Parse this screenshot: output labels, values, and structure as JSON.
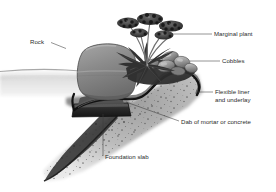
{
  "figure": {
    "background_color": "#ffffff",
    "line_color": "#3a3a3a",
    "text_color": "#2b2b2b"
  },
  "labels": {
    "rock": "Rock",
    "marginal_plant": "Marginal plant",
    "cobbles": "Cobbles",
    "flexible_liner_line1": "Flexible liner",
    "flexible_liner_line2": "and underlay",
    "mortar": "Dab of mortar or concrete",
    "foundation_slab": "Foundation slab"
  },
  "elements": {
    "rock": {
      "name": "rock-boulder",
      "fill": "#8d8d8d"
    },
    "plant": {
      "name": "marginal-plant",
      "fill": "#3f3f3f"
    },
    "cobbles": {
      "name": "cobble-stones",
      "fill": "#a2a2a2"
    },
    "liner": {
      "name": "flexible-liner",
      "fill": "#1f1f1f"
    },
    "mortar": {
      "name": "mortar-dab",
      "fill": "#4a4a4a"
    },
    "slab": {
      "name": "foundation-slab",
      "fill": "#2e2e2e"
    },
    "soil": {
      "name": "soil-bank",
      "fill": "#b6b6b6"
    },
    "water": {
      "name": "water-surface",
      "fill": "#d8d8d8"
    }
  }
}
